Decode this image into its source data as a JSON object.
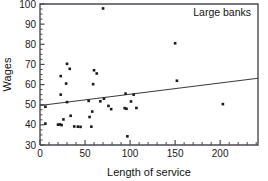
{
  "chart_data": {
    "type": "scatter",
    "title": "",
    "annotation": "Large banks",
    "xlabel": "Length of service",
    "ylabel": "Wages",
    "xlim": [
      0,
      242
    ],
    "ylim": [
      30,
      100
    ],
    "xticks": [
      0,
      50,
      100,
      150,
      200
    ],
    "yticks": [
      30,
      40,
      50,
      60,
      70,
      80,
      90,
      100
    ],
    "xtick_labels": [
      "0",
      "50",
      "100",
      "150",
      "200"
    ],
    "ytick_labels": [
      "30",
      "40",
      "50",
      "60",
      "70",
      "80",
      "90",
      "100"
    ],
    "x_minor_step": 10,
    "y_minor_step": 2.5,
    "grid": false,
    "legend": false,
    "marker": "square",
    "marker_color": "#1a1a1a",
    "fit_line": {
      "label": "linear fit",
      "color": "#3a3a42",
      "x_start": 0,
      "y_start": 49.6,
      "x_end": 242,
      "y_end": 63.1
    },
    "points": [
      {
        "x": 6,
        "y": 49.0
      },
      {
        "x": 6,
        "y": 40.6
      },
      {
        "x": 20,
        "y": 40.1
      },
      {
        "x": 22,
        "y": 40.2
      },
      {
        "x": 23,
        "y": 64.2
      },
      {
        "x": 23,
        "y": 55.0
      },
      {
        "x": 24,
        "y": 39.9
      },
      {
        "x": 26,
        "y": 42.7
      },
      {
        "x": 29,
        "y": 60.5
      },
      {
        "x": 30,
        "y": 70.3
      },
      {
        "x": 30,
        "y": 51.3
      },
      {
        "x": 33,
        "y": 67.8
      },
      {
        "x": 34,
        "y": 44.5
      },
      {
        "x": 38,
        "y": 39.2
      },
      {
        "x": 42,
        "y": 39.1
      },
      {
        "x": 45,
        "y": 39.0
      },
      {
        "x": 54,
        "y": 51.9
      },
      {
        "x": 55,
        "y": 43.9
      },
      {
        "x": 57,
        "y": 39.1
      },
      {
        "x": 58,
        "y": 46.6
      },
      {
        "x": 59,
        "y": 60.2
      },
      {
        "x": 60,
        "y": 67.1
      },
      {
        "x": 63,
        "y": 65.5
      },
      {
        "x": 67,
        "y": 51.7
      },
      {
        "x": 70,
        "y": 97.8
      },
      {
        "x": 71,
        "y": 53.0
      },
      {
        "x": 76,
        "y": 49.4
      },
      {
        "x": 79,
        "y": 47.8
      },
      {
        "x": 94,
        "y": 48.3
      },
      {
        "x": 95,
        "y": 55.5
      },
      {
        "x": 96,
        "y": 48.0
      },
      {
        "x": 97,
        "y": 34.3
      },
      {
        "x": 101,
        "y": 51.6
      },
      {
        "x": 104,
        "y": 55.0
      },
      {
        "x": 107,
        "y": 48.4
      },
      {
        "x": 150,
        "y": 80.5
      },
      {
        "x": 152,
        "y": 61.9
      },
      {
        "x": 203,
        "y": 50.3
      }
    ]
  },
  "geometry": {
    "plot_left": 40,
    "plot_right": 258,
    "plot_top": 4,
    "plot_bottom": 145
  }
}
